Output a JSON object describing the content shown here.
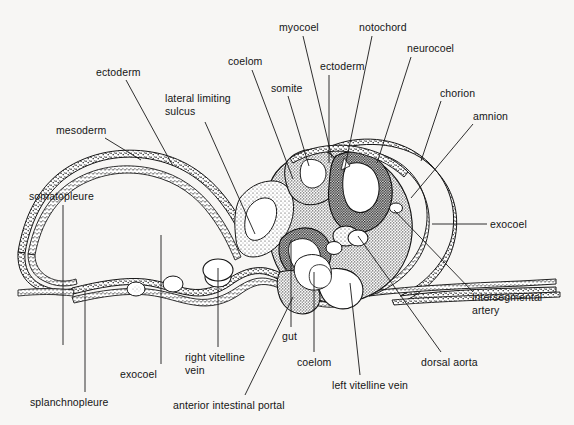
{
  "figure": {
    "type": "anatomical-illustration",
    "background_color": "#f7f6f4",
    "ink_color": "#151515",
    "width": 574,
    "height": 425
  },
  "labels": [
    {
      "id": "ectoderm-left",
      "text": "ectoderm",
      "x": 96,
      "y": 66,
      "align": "left"
    },
    {
      "id": "lateral-limiting-sulcus",
      "text": "lateral limiting\nsulcus",
      "x": 165,
      "y": 92,
      "align": "left"
    },
    {
      "id": "mesoderm",
      "text": "mesoderm",
      "x": 56,
      "y": 124,
      "align": "left"
    },
    {
      "id": "somatopleure",
      "text": "somatopleure",
      "x": 29,
      "y": 190,
      "align": "left"
    },
    {
      "id": "coelom-top",
      "text": "coelom",
      "x": 228,
      "y": 55,
      "align": "left"
    },
    {
      "id": "somite",
      "text": "somite",
      "x": 271,
      "y": 82,
      "align": "left"
    },
    {
      "id": "myocoel",
      "text": "myocoel",
      "x": 279,
      "y": 21,
      "align": "left"
    },
    {
      "id": "ectoderm-top",
      "text": "ectoderm",
      "x": 320,
      "y": 60,
      "align": "left"
    },
    {
      "id": "notochord",
      "text": "notochord",
      "x": 359,
      "y": 21,
      "align": "left"
    },
    {
      "id": "neurocoel",
      "text": "neurocoel",
      "x": 407,
      "y": 42,
      "align": "left"
    },
    {
      "id": "chorion",
      "text": "chorion",
      "x": 440,
      "y": 87,
      "align": "left"
    },
    {
      "id": "amnion",
      "text": "amnion",
      "x": 473,
      "y": 110,
      "align": "left"
    },
    {
      "id": "exocoel-right",
      "text": "exocoel",
      "x": 490,
      "y": 218,
      "align": "left"
    },
    {
      "id": "intersegmental-artery",
      "text": "intersegmental\nartery",
      "x": 472,
      "y": 291,
      "align": "left"
    },
    {
      "id": "dorsal-aorta",
      "text": "dorsal aorta",
      "x": 421,
      "y": 356,
      "align": "left"
    },
    {
      "id": "left-vitelline-vein",
      "text": "left vitelline vein",
      "x": 332,
      "y": 379,
      "align": "left"
    },
    {
      "id": "coelom-bottom",
      "text": "coelom",
      "x": 297,
      "y": 356,
      "align": "left"
    },
    {
      "id": "gut",
      "text": "gut",
      "x": 282,
      "y": 330,
      "align": "left"
    },
    {
      "id": "anterior-intestinal-portal",
      "text": "anterior intestinal portal",
      "x": 173,
      "y": 399,
      "align": "left"
    },
    {
      "id": "right-vitelline-vein",
      "text": "right vitelline\nvein",
      "x": 185,
      "y": 351,
      "align": "left"
    },
    {
      "id": "exocoel-left",
      "text": "exocoel",
      "x": 120,
      "y": 368,
      "align": "left"
    },
    {
      "id": "splanchnopleure",
      "text": "splanchnopleure",
      "x": 30,
      "y": 396,
      "align": "left"
    }
  ],
  "leaders": [
    {
      "id": "leader-ectoderm-left",
      "d": "M 126 80 L 173 166"
    },
    {
      "id": "leader-lateral-limiting-sulcus",
      "d": "M 205 122 L 255 234"
    },
    {
      "id": "leader-mesoderm",
      "d": "M 105 138 L 141 160"
    },
    {
      "id": "leader-somatopleure",
      "d": "M 63 205 L 63 345"
    },
    {
      "id": "leader-coelom-top",
      "d": "M 252 70 L 293 179"
    },
    {
      "id": "leader-somite",
      "d": "M 288 96 L 309 166"
    },
    {
      "id": "leader-myocoel",
      "d": "M 303 36 L 332 158"
    },
    {
      "id": "leader-ectoderm-top",
      "d": "M 329 75 L 329 163"
    },
    {
      "id": "leader-notochord",
      "d": "M 372 36 L 344 172"
    },
    {
      "id": "leader-neurocoel",
      "d": "M 411 57 L 377 163"
    },
    {
      "id": "leader-chorion",
      "d": "M 441 101 L 421 161"
    },
    {
      "id": "leader-amnion",
      "d": "M 473 124 L 411 198"
    },
    {
      "id": "leader-exocoel-right",
      "d": "M 487 224 L 432 224"
    },
    {
      "id": "leader-intersegmental-artery",
      "d": "M 473 292 L 394 210"
    },
    {
      "id": "leader-dorsal-aorta",
      "d": "M 441 352 L 358 236"
    },
    {
      "id": "leader-left-vitelline-vein",
      "d": "M 360 375 L 350 283"
    },
    {
      "id": "leader-coelom-bottom",
      "d": "M 314 352 L 314 272"
    },
    {
      "id": "leader-gut",
      "d": "M 291 327 L 291 240"
    },
    {
      "id": "leader-anterior-intestinal-portal",
      "d": "M 245 395 L 293 297"
    },
    {
      "id": "leader-right-vitelline-vein",
      "d": "M 218 347 L 218 268"
    },
    {
      "id": "leader-exocoel-left",
      "d": "M 161 364 L 161 235"
    },
    {
      "id": "leader-splanchnopleure",
      "d": "M 85 392 L 85 291"
    }
  ]
}
